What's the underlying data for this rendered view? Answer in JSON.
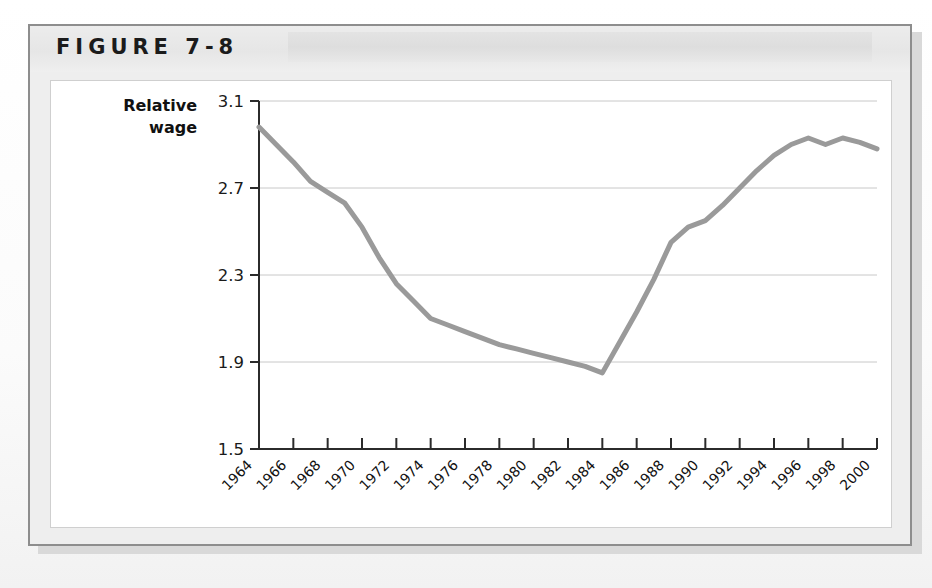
{
  "figure": {
    "label": "FIGURE 7-8",
    "title": ""
  },
  "chart_data": {
    "type": "line",
    "title": "",
    "xlabel": "",
    "ylabel": "Relative wage",
    "ylabel_lines": [
      "Relative",
      "wage"
    ],
    "ylim": [
      1.5,
      3.1
    ],
    "yticks": [
      1.5,
      1.9,
      2.3,
      2.7,
      3.1
    ],
    "ytick_labels": [
      "1.5",
      "1.9",
      "2.3",
      "2.7",
      "3.1"
    ],
    "grid": true,
    "grid_axis": "y",
    "legend": "none",
    "xlim": [
      1964,
      2000
    ],
    "xticks": [
      1964,
      1966,
      1968,
      1970,
      1972,
      1974,
      1976,
      1978,
      1980,
      1982,
      1984,
      1986,
      1988,
      1990,
      1992,
      1994,
      1996,
      1998,
      2000
    ],
    "xtick_labels": [
      "1964",
      "1966",
      "1968",
      "1970",
      "1972",
      "1974",
      "1976",
      "1978",
      "1980",
      "1982",
      "1984",
      "1986",
      "1988",
      "1990",
      "1992",
      "1994",
      "1996",
      "1998",
      "2000"
    ],
    "xtick_rotation": 45,
    "line_color": "#9a9a9a",
    "line_width": 5,
    "series": [
      {
        "name": "Relative wage",
        "x": [
          1964,
          1965,
          1966,
          1967,
          1968,
          1969,
          1970,
          1971,
          1972,
          1973,
          1974,
          1975,
          1976,
          1977,
          1978,
          1979,
          1980,
          1981,
          1982,
          1983,
          1984,
          1985,
          1986,
          1987,
          1988,
          1989,
          1990,
          1991,
          1992,
          1993,
          1994,
          1995,
          1996,
          1997,
          1998,
          1999,
          2000
        ],
        "values": [
          2.98,
          2.9,
          2.82,
          2.73,
          2.68,
          2.63,
          2.52,
          2.38,
          2.26,
          2.18,
          2.1,
          2.07,
          2.04,
          2.01,
          1.98,
          1.96,
          1.94,
          1.92,
          1.9,
          1.88,
          1.85,
          1.99,
          2.13,
          2.28,
          2.45,
          2.52,
          2.55,
          2.62,
          2.7,
          2.78,
          2.85,
          2.9,
          2.93,
          2.9,
          2.93,
          2.91,
          2.88
        ]
      }
    ]
  }
}
